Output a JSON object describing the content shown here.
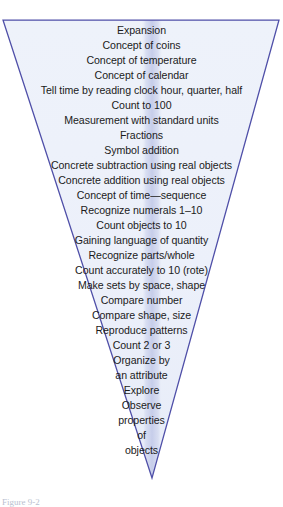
{
  "figure": {
    "type": "inverted-triangle-funnel",
    "caption": "Figure 9-2",
    "colors": {
      "fill_top": "#eef2fa",
      "fill_bottom": "#e9eef9",
      "center_band": "#ccd3ee",
      "outline": "#4f4fa8",
      "text": "#1b1b1b",
      "page_background": "#ffffff"
    },
    "geometry": {
      "top_left_x": 3,
      "top_right_x": 279,
      "top_y": 20,
      "apex_x": 152,
      "apex_y": 478,
      "band_top_width": 22,
      "band_bottom_width": 16
    }
  },
  "concepts": [
    {
      "y": 30,
      "label": "Expansion"
    },
    {
      "y": 45,
      "label": "Concept of coins"
    },
    {
      "y": 60,
      "label": "Concept of temperature"
    },
    {
      "y": 75,
      "label": "Concept of calendar"
    },
    {
      "y": 90,
      "label": "Tell time by reading clock hour, quarter, half"
    },
    {
      "y": 105,
      "label": "Count to 100"
    },
    {
      "y": 120,
      "label": "Measurement with standard units"
    },
    {
      "y": 135,
      "label": "Fractions"
    },
    {
      "y": 150,
      "label": "Symbol addition"
    },
    {
      "y": 165,
      "label": "Concrete subtraction using real objects"
    },
    {
      "y": 180,
      "label": "Concrete addition using real objects"
    },
    {
      "y": 195,
      "label": "Concept of time—sequence"
    },
    {
      "y": 210,
      "label": "Recognize numerals 1–10"
    },
    {
      "y": 225,
      "label": "Count objects to 10"
    },
    {
      "y": 240,
      "label": "Gaining language of quantity"
    },
    {
      "y": 255,
      "label": "Recognize parts/whole"
    },
    {
      "y": 270,
      "label": "Count accurately to 10 (rote)"
    },
    {
      "y": 285,
      "label": "Make sets by space, shape"
    },
    {
      "y": 300,
      "label": "Compare number"
    },
    {
      "y": 315,
      "label": "Compare shape, size"
    },
    {
      "y": 330,
      "label": "Reproduce patterns"
    },
    {
      "y": 345,
      "label": "Count 2 or 3"
    },
    {
      "y": 360,
      "label": "Organize by"
    },
    {
      "y": 375,
      "label": "an attribute"
    },
    {
      "y": 390,
      "label": "Explore"
    },
    {
      "y": 405,
      "label": "Observe"
    },
    {
      "y": 420,
      "label": "properties"
    },
    {
      "y": 435,
      "label": "of"
    },
    {
      "y": 450,
      "label": "objects"
    }
  ]
}
